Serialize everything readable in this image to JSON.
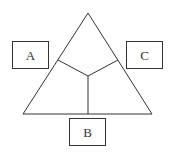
{
  "diagram": {
    "type": "triangle-partition",
    "stroke_color": "#333333",
    "background": "#ffffff",
    "triangle": {
      "apex": [
        88,
        13
      ],
      "base_left": [
        23,
        114
      ],
      "base_right": [
        152,
        114
      ]
    },
    "center": [
      88,
      76
    ],
    "dividers": [
      {
        "to": [
          58,
          60
        ]
      },
      {
        "to": [
          118,
          60
        ]
      },
      {
        "to": [
          88,
          114
        ]
      }
    ],
    "boxes": [
      {
        "id": "A",
        "label": "A",
        "x": 12,
        "y": 41,
        "w": 37,
        "h": 28
      },
      {
        "id": "C",
        "label": "C",
        "x": 126,
        "y": 41,
        "w": 37,
        "h": 28
      },
      {
        "id": "B",
        "label": "B",
        "x": 69,
        "y": 118,
        "w": 37,
        "h": 28
      }
    ]
  }
}
